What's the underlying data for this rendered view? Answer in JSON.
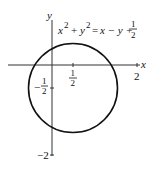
{
  "figure": {
    "equation": {
      "lhs_x": "x",
      "lhs_x_exp": "2",
      "plus": "+",
      "lhs_y": "y",
      "lhs_y_exp": "2",
      "equals": "=",
      "rhs": "x − y +",
      "rhs_frac_num": "1",
      "rhs_frac_den": "2"
    },
    "axes": {
      "x_label": "x",
      "y_label": "y",
      "x_ticks": [
        {
          "num": "1",
          "den": "2",
          "value": 0.5
        },
        {
          "label": "2",
          "value": 2
        }
      ],
      "y_ticks": [
        {
          "sign": "−",
          "num": "1",
          "den": "2",
          "value": -0.5
        },
        {
          "label": "−2",
          "value": -2
        }
      ]
    },
    "circle": {
      "center": [
        0.5,
        -0.5
      ],
      "radius": 1,
      "color": "#111111"
    }
  }
}
